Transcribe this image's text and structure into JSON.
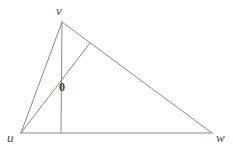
{
  "figure": {
    "kind": "geometry-diagram",
    "width": 233,
    "height": 150,
    "background_color": "#ffffff",
    "line_color": "#8a8a8a",
    "label_color": "#4a4a4a",
    "point_label_color": "#3d3d3d",
    "line_width": 1
  },
  "labels": {
    "apex": "v",
    "lower_left": "u",
    "lower_right": "w",
    "interior_point": "0"
  },
  "points": {
    "v": {
      "x": 62,
      "y": 22
    },
    "u": {
      "x": 21,
      "y": 133
    },
    "w": {
      "x": 212,
      "y": 133
    },
    "foot": {
      "x": 61,
      "y": 133
    },
    "side_point": {
      "x": 90,
      "y": 43
    },
    "interior": {
      "x": 57,
      "y": 85
    }
  },
  "segments": [
    {
      "name": "u-v",
      "from": "u",
      "to": "v"
    },
    {
      "name": "v-w",
      "from": "v",
      "to": "w"
    },
    {
      "name": "u-w",
      "from": "u",
      "to": "w"
    },
    {
      "name": "v-foot",
      "from": "v",
      "to": "foot"
    },
    {
      "name": "u-side-point",
      "from": "u",
      "to": "side_point"
    }
  ]
}
